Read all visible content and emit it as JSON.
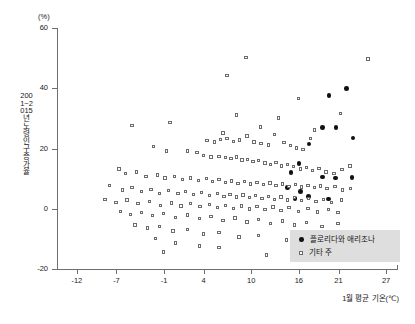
{
  "chart": {
    "type": "scatter",
    "unit_y": "(%)",
    "axis_title_y": "2001~2015년 노령인구 증가율",
    "axis_title_x": "1월 평균 기온(℃)",
    "y_ticks": [
      60,
      40,
      20,
      0,
      -20
    ],
    "y_tick_labels": [
      "60",
      "40",
      "20",
      "0",
      "-20"
    ],
    "x_ticks": [
      -12,
      -7,
      -1,
      4,
      10,
      16,
      21,
      27
    ],
    "x_tick_labels": [
      "-12",
      "-7",
      "-1",
      "4",
      "10",
      "16",
      "21",
      "27"
    ],
    "legend": {
      "items": [
        {
          "label": "플로리다와 애리조나",
          "marker": "filled-circle",
          "color": "#111111"
        },
        {
          "label": "기타 주",
          "marker": "open-square",
          "color": "#6b6b6b"
        }
      ]
    }
  },
  "chart_data": {
    "type": "scatter",
    "title": "",
    "subtitle": "",
    "xlabel": "1월 평균 기온(℃)",
    "ylabel": "2001~2015년 노령인구 증가율",
    "yunit": "(%)",
    "xlim": [
      -14.5,
      28.5
    ],
    "ylim": [
      -20,
      60
    ],
    "xticks": [
      -12,
      -7,
      -1,
      4,
      10,
      16,
      21,
      27
    ],
    "yticks": [
      -20,
      0,
      20,
      40,
      60
    ],
    "grid": false,
    "legend_position": "bottom-right",
    "series": [
      {
        "name": "플로리다와 애리조나",
        "marker": "filled-circle",
        "color": "#111111",
        "points": [
          [
            19.8,
            37.5
          ],
          [
            22.0,
            40.0
          ],
          [
            19.0,
            27.0
          ],
          [
            20.7,
            27.0
          ],
          [
            22.8,
            23.5
          ],
          [
            17.3,
            21.5
          ],
          [
            16.0,
            15.0
          ],
          [
            15.0,
            12.0
          ],
          [
            19.0,
            10.5
          ],
          [
            20.6,
            10.2
          ],
          [
            22.7,
            10.3
          ],
          [
            14.6,
            7.0
          ],
          [
            16.2,
            5.8
          ],
          [
            17.2,
            4.0
          ],
          [
            15.5,
            3.5
          ],
          [
            19.7,
            3.2
          ]
        ]
      },
      {
        "name": "기타 주",
        "marker": "open-square",
        "color": "#6b6b6b",
        "points": [
          [
            9.4,
            50.0
          ],
          [
            24.8,
            49.5
          ],
          [
            7.0,
            44.0
          ],
          [
            16.0,
            36.5
          ],
          [
            8.2,
            31.0
          ],
          [
            21.3,
            31.5
          ],
          [
            13.5,
            30.0
          ],
          [
            -5.0,
            27.5
          ],
          [
            -0.2,
            28.5
          ],
          [
            11.2,
            27.0
          ],
          [
            18.0,
            26.0
          ],
          [
            6.5,
            25.0
          ],
          [
            9.5,
            24.0
          ],
          [
            13.0,
            24.5
          ],
          [
            17.5,
            23.2
          ],
          [
            4.5,
            22.5
          ],
          [
            5.4,
            22.0
          ],
          [
            6.2,
            22.8
          ],
          [
            7.0,
            23.2
          ],
          [
            7.8,
            22.2
          ],
          [
            8.6,
            22.6
          ],
          [
            10.4,
            22.0
          ],
          [
            11.3,
            21.5
          ],
          [
            12.2,
            21.0
          ],
          [
            14.2,
            21.8
          ],
          [
            15.0,
            20.8
          ],
          [
            15.8,
            20.0
          ],
          [
            16.6,
            19.5
          ],
          [
            -2.3,
            20.5
          ],
          [
            -0.6,
            19.0
          ],
          [
            2.0,
            19.0
          ],
          [
            3.2,
            18.5
          ],
          [
            4.0,
            17.5
          ],
          [
            5.0,
            17.0
          ],
          [
            6.0,
            17.2
          ],
          [
            6.8,
            16.8
          ],
          [
            7.5,
            16.5
          ],
          [
            8.2,
            17.0
          ],
          [
            8.9,
            16.0
          ],
          [
            9.6,
            16.2
          ],
          [
            10.3,
            15.5
          ],
          [
            11.0,
            15.8
          ],
          [
            11.8,
            15.0
          ],
          [
            12.5,
            14.5
          ],
          [
            13.2,
            15.2
          ],
          [
            13.9,
            14.0
          ],
          [
            14.6,
            14.6
          ],
          [
            15.4,
            13.8
          ],
          [
            16.3,
            13.0
          ],
          [
            17.0,
            13.5
          ],
          [
            17.8,
            12.5
          ],
          [
            18.6,
            13.2
          ],
          [
            19.5,
            12.0
          ],
          [
            20.5,
            11.5
          ],
          [
            21.5,
            12.8
          ],
          [
            22.5,
            14.0
          ],
          [
            -6.6,
            13.0
          ],
          [
            -5.8,
            11.5
          ],
          [
            -4.4,
            12.0
          ],
          [
            -3.2,
            10.5
          ],
          [
            -1.8,
            11.0
          ],
          [
            -0.8,
            10.0
          ],
          [
            0.4,
            10.5
          ],
          [
            1.4,
            9.5
          ],
          [
            2.4,
            10.0
          ],
          [
            3.4,
            9.2
          ],
          [
            4.4,
            9.8
          ],
          [
            5.2,
            8.8
          ],
          [
            6.0,
            9.5
          ],
          [
            6.8,
            8.5
          ],
          [
            7.6,
            9.0
          ],
          [
            8.4,
            8.2
          ],
          [
            9.2,
            8.8
          ],
          [
            10.0,
            8.0
          ],
          [
            10.8,
            8.6
          ],
          [
            11.6,
            7.8
          ],
          [
            12.4,
            8.4
          ],
          [
            13.2,
            7.5
          ],
          [
            14.0,
            8.0
          ],
          [
            14.8,
            7.2
          ],
          [
            15.6,
            7.8
          ],
          [
            16.4,
            7.0
          ],
          [
            17.2,
            7.6
          ],
          [
            18.0,
            6.8
          ],
          [
            18.8,
            7.4
          ],
          [
            19.6,
            6.5
          ],
          [
            20.6,
            7.2
          ],
          [
            21.6,
            6.0
          ],
          [
            22.6,
            6.5
          ],
          [
            -7.8,
            7.5
          ],
          [
            -6.2,
            6.0
          ],
          [
            -5.0,
            6.8
          ],
          [
            -3.8,
            5.5
          ],
          [
            -2.6,
            6.2
          ],
          [
            -1.5,
            5.0
          ],
          [
            -0.4,
            5.8
          ],
          [
            0.8,
            4.8
          ],
          [
            1.8,
            5.5
          ],
          [
            2.8,
            4.5
          ],
          [
            3.8,
            5.2
          ],
          [
            4.8,
            4.2
          ],
          [
            5.8,
            5.0
          ],
          [
            6.6,
            4.0
          ],
          [
            7.4,
            4.6
          ],
          [
            8.2,
            3.8
          ],
          [
            9.0,
            4.4
          ],
          [
            9.8,
            3.5
          ],
          [
            10.6,
            4.2
          ],
          [
            11.4,
            3.2
          ],
          [
            12.2,
            4.0
          ],
          [
            13.0,
            3.0
          ],
          [
            13.8,
            3.8
          ],
          [
            14.6,
            2.8
          ],
          [
            15.5,
            3.5
          ],
          [
            16.4,
            2.5
          ],
          [
            17.3,
            3.2
          ],
          [
            18.2,
            2.2
          ],
          [
            19.2,
            3.0
          ],
          [
            20.2,
            2.0
          ],
          [
            21.4,
            2.8
          ],
          [
            -8.4,
            3.0
          ],
          [
            -7.0,
            2.0
          ],
          [
            -5.6,
            2.8
          ],
          [
            -4.2,
            1.5
          ],
          [
            -2.8,
            2.2
          ],
          [
            -1.4,
            1.0
          ],
          [
            0.0,
            1.8
          ],
          [
            1.2,
            0.8
          ],
          [
            2.4,
            1.5
          ],
          [
            3.6,
            0.5
          ],
          [
            4.8,
            1.2
          ],
          [
            5.8,
            0.2
          ],
          [
            6.8,
            1.0
          ],
          [
            7.8,
            0.0
          ],
          [
            8.8,
            0.8
          ],
          [
            9.8,
            -0.2
          ],
          [
            10.8,
            0.6
          ],
          [
            11.8,
            -0.5
          ],
          [
            12.8,
            0.4
          ],
          [
            13.8,
            -0.8
          ],
          [
            14.8,
            0.2
          ],
          [
            16.0,
            -1.0
          ],
          [
            17.2,
            0.0
          ],
          [
            18.4,
            -1.2
          ],
          [
            19.8,
            -0.5
          ],
          [
            21.0,
            -1.5
          ],
          [
            -6.4,
            -1.0
          ],
          [
            -5.2,
            -2.0
          ],
          [
            -3.8,
            -1.5
          ],
          [
            -2.4,
            -2.5
          ],
          [
            -1.0,
            -1.8
          ],
          [
            0.5,
            -3.0
          ],
          [
            2.0,
            -2.2
          ],
          [
            3.5,
            -3.5
          ],
          [
            5.0,
            -2.8
          ],
          [
            6.5,
            -4.0
          ],
          [
            8.0,
            -3.2
          ],
          [
            9.5,
            -4.5
          ],
          [
            11.0,
            -3.8
          ],
          [
            12.5,
            -5.0
          ],
          [
            14.0,
            -4.2
          ],
          [
            15.5,
            -5.5
          ],
          [
            17.0,
            -4.8
          ],
          [
            19.0,
            -6.0
          ],
          [
            21.0,
            -5.0
          ],
          [
            -4.6,
            -5.5
          ],
          [
            -3.0,
            -6.5
          ],
          [
            -1.5,
            -6.0
          ],
          [
            0.2,
            -7.5
          ],
          [
            2.0,
            -7.0
          ],
          [
            4.0,
            -8.5
          ],
          [
            6.0,
            -8.0
          ],
          [
            8.5,
            -9.5
          ],
          [
            11.0,
            -9.0
          ],
          [
            14.5,
            -10.5
          ],
          [
            18.0,
            -11.0
          ],
          [
            -2.0,
            -10.0
          ],
          [
            0.5,
            -11.5
          ],
          [
            3.5,
            -12.5
          ],
          [
            6.0,
            -13.0
          ],
          [
            -1.0,
            -14.5
          ],
          [
            12.0,
            -15.5
          ]
        ]
      }
    ]
  }
}
